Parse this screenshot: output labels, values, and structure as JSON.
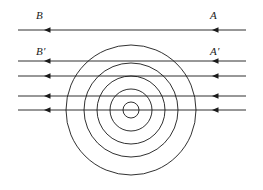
{
  "figure": {
    "background_color": "#ffffff",
    "stroke_color": "#1a1a1a",
    "width": 263,
    "height": 190
  },
  "labels": [
    {
      "name": "label-B",
      "text": "B",
      "x": 36,
      "y": 10,
      "italic": true
    },
    {
      "name": "label-A",
      "text": "A",
      "x": 210,
      "y": 10,
      "italic": true
    },
    {
      "name": "label-B-prime",
      "text": "B′",
      "x": 36,
      "y": 46,
      "italic": true
    },
    {
      "name": "label-A-prime",
      "text": "A′",
      "x": 210,
      "y": 46,
      "italic": true
    }
  ],
  "straight_lines": [
    {
      "name": "line-BA",
      "y": 30,
      "x_start": 18,
      "x_end": 246,
      "arrows_at": [
        44,
        212
      ],
      "arrow_direction": "left"
    },
    {
      "name": "line-1",
      "y": 61,
      "x_start": 18,
      "x_end": 246,
      "arrows_at": [
        44,
        212
      ],
      "arrow_direction": "left"
    },
    {
      "name": "line-2",
      "y": 76,
      "x_start": 18,
      "x_end": 246,
      "arrows_at": [
        44,
        212
      ],
      "arrow_direction": "left"
    },
    {
      "name": "line-3",
      "y": 96,
      "x_start": 18,
      "x_end": 246,
      "arrows_at": [
        44,
        212
      ],
      "arrow_direction": "left"
    },
    {
      "name": "line-4",
      "y": 110,
      "x_start": 18,
      "x_end": 246,
      "arrows_at": [
        44,
        212
      ],
      "arrow_direction": "left"
    }
  ],
  "circles": {
    "center_x": 131,
    "center_y": 110,
    "radii": [
      8,
      21,
      34,
      47,
      65
    ]
  },
  "chart_data": {
    "type": "diagram",
    "circle_radii": [
      8,
      21,
      34,
      47,
      65
    ],
    "line_y_values": [
      30,
      61,
      76,
      96,
      110
    ],
    "arrow_direction": "left",
    "labels": [
      "B",
      "A",
      "B′",
      "A′"
    ]
  }
}
